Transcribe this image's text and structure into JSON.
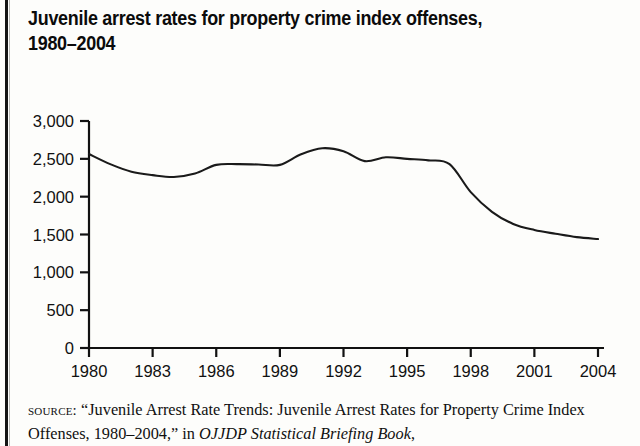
{
  "page": {
    "title_line1": "Juvenile arrest rates for property crime index offenses,",
    "title_line2": "1980–2004",
    "title_full": "Juvenile arrest rates for property crime index offenses, 1980–2004"
  },
  "source_note": {
    "label": "source:",
    "text_part1": "“Juvenile Arrest Rate Trends: Juvenile Arrest Rates for Property Crime Index Offenses, 1980–2004,” in ",
    "publication": "OJJDP Statistical Briefing Book",
    "text_part2": ","
  },
  "chart_data": {
    "type": "line",
    "title": "Juvenile arrest rates for property crime index offenses, 1980–2004",
    "xlabel": "",
    "ylabel": "",
    "xlim": [
      1980,
      2004
    ],
    "ylim": [
      0,
      3000
    ],
    "grid": false,
    "legend": null,
    "line_color": "#1a1a1a",
    "x_tick_labels": [
      "1980",
      "1983",
      "1986",
      "1989",
      "1992",
      "1995",
      "1998",
      "2001",
      "2004"
    ],
    "x_ticks": [
      1980,
      1983,
      1986,
      1989,
      1992,
      1995,
      1998,
      2001,
      2004
    ],
    "y_tick_labels": [
      "0",
      "500",
      "1,000",
      "1,500",
      "2,000",
      "2,500",
      "3,000"
    ],
    "y_ticks": [
      0,
      500,
      1000,
      1500,
      2000,
      2500,
      3000
    ],
    "x": [
      1980,
      1981,
      1982,
      1983,
      1984,
      1985,
      1986,
      1987,
      1988,
      1989,
      1990,
      1991,
      1992,
      1993,
      1994,
      1995,
      1996,
      1997,
      1998,
      1999,
      2000,
      2001,
      2002,
      2003,
      2004
    ],
    "values": [
      2563,
      2430,
      2330,
      2285,
      2260,
      2305,
      2420,
      2430,
      2425,
      2420,
      2560,
      2640,
      2600,
      2470,
      2520,
      2500,
      2480,
      2430,
      2060,
      1800,
      1640,
      1560,
      1510,
      1465,
      1440
    ],
    "series": [
      {
        "name": "Juvenile property crime index arrest rate",
        "values": [
          2563,
          2430,
          2330,
          2285,
          2260,
          2305,
          2420,
          2430,
          2425,
          2420,
          2560,
          2640,
          2600,
          2470,
          2520,
          2500,
          2480,
          2430,
          2060,
          1800,
          1640,
          1560,
          1510,
          1465,
          1440
        ]
      }
    ]
  }
}
